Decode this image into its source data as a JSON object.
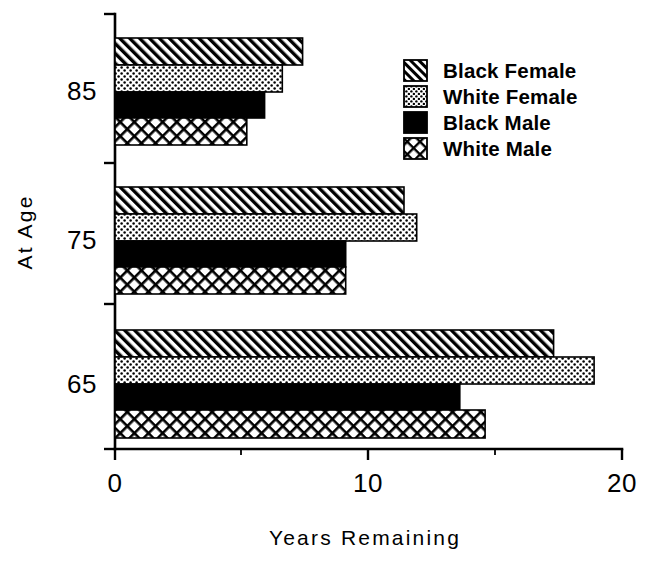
{
  "chart_data": {
    "type": "bar",
    "orientation": "horizontal",
    "title": "",
    "xlabel": "Years Remaining",
    "ylabel": "At Age",
    "categories": [
      "85",
      "75",
      "65"
    ],
    "xlim": [
      0,
      20
    ],
    "xticks": [
      0,
      10,
      20
    ],
    "xtick_labels": [
      "0",
      "10",
      "20"
    ],
    "ytick_labels": [
      "85",
      "75",
      "65"
    ],
    "grid": false,
    "legend_position": "upper right",
    "series": [
      {
        "name": "Black Female",
        "pattern": "diagonal-hatch",
        "color": "#000000",
        "values": [
          7.4,
          11.4,
          17.3
        ]
      },
      {
        "name": "White Female",
        "pattern": "dotted",
        "color": "#000000",
        "values": [
          6.6,
          11.9,
          18.9
        ]
      },
      {
        "name": "Black Male",
        "pattern": "solid",
        "color": "#000000",
        "values": [
          5.9,
          9.1,
          13.6
        ]
      },
      {
        "name": "White Male",
        "pattern": "crosshatch",
        "color": "#000000",
        "values": [
          5.2,
          9.1,
          14.6
        ]
      }
    ]
  },
  "axes": {
    "x_title": "Years Remaining",
    "y_title": "At Age",
    "x_tick_0": "0",
    "x_tick_10": "10",
    "x_tick_20": "20",
    "y_tick_85": "85",
    "y_tick_75": "75",
    "y_tick_65": "65"
  },
  "legend": {
    "items": [
      {
        "label": "Black Female",
        "swatch": "diagonal-hatch-swatch"
      },
      {
        "label": "White Female",
        "swatch": "dotted-swatch"
      },
      {
        "label": "Black Male",
        "swatch": "solid-black-swatch"
      },
      {
        "label": "White Male",
        "swatch": "crosshatch-swatch"
      }
    ]
  }
}
